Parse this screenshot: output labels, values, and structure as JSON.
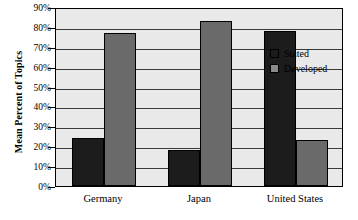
{
  "chart_data": {
    "type": "bar",
    "title": "",
    "subtitle": "",
    "xlabel": "",
    "ylabel": "Mean Percent of Topics",
    "categories": [
      "Germany",
      "Japan",
      "United States"
    ],
    "series": [
      {
        "name": "Stated",
        "color": "#1c1c1c",
        "values": [
          24,
          18,
          78
        ]
      },
      {
        "name": "Developed",
        "color": "#6a6a6a",
        "values": [
          77,
          83,
          23
        ]
      }
    ],
    "ylim": [
      0,
      90
    ],
    "ytick_step": 10,
    "ytick_labels": [
      "90%",
      "80%",
      "70%",
      "60%",
      "50%",
      "40%",
      "30%",
      "20%",
      "10%",
      "0%"
    ],
    "ytick_values": [
      90,
      80,
      70,
      60,
      50,
      40,
      30,
      20,
      10,
      0
    ],
    "value_suffix": "%",
    "grid": true,
    "grid_axis": "y",
    "legend_position": "right-inside",
    "legend_entries": [
      "Stated",
      "Developed"
    ],
    "plot_background": "#e9e9e9",
    "grid_color": "#3a3a3a",
    "axis_color": "#000000",
    "annotations": []
  }
}
